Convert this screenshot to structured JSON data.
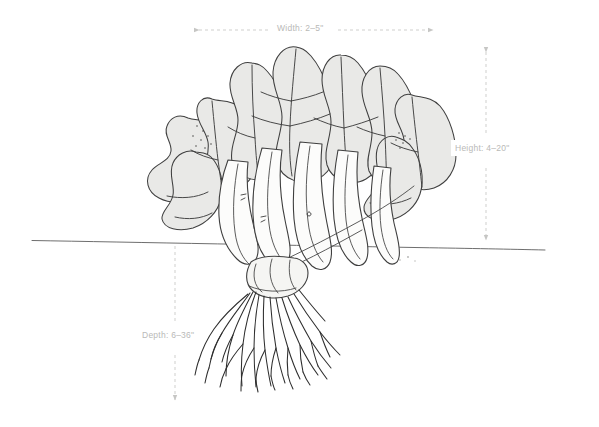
{
  "diagram": {
    "background_color": "#ffffff",
    "ink_color": "#3a3a3a",
    "leaf_fill_color": "#e9e9e7",
    "stem_fill_color": "#fbfbfa",
    "dimension_line_color": "#cfcfcd",
    "label_color": "#b9b9b7",
    "soil_line_color": "#6b6b6b"
  },
  "dimensions": {
    "width": {
      "label": "Width: 2–5\"",
      "icon": "horizontal-double-arrow-icon",
      "orientation": "horizontal",
      "min_inches": 2,
      "max_inches": 5
    },
    "height": {
      "label": "Height: 4–20\"",
      "icon": "vertical-double-arrow-icon",
      "orientation": "vertical",
      "min_inches": 4,
      "max_inches": 20
    },
    "depth": {
      "label": "Depth: 6–36\"",
      "icon": "vertical-double-arrow-icon",
      "orientation": "vertical",
      "min_inches": 6,
      "max_inches": 36
    }
  },
  "soil_line": {
    "name": "soil-surface-line",
    "description": "horizontal ground level line"
  }
}
